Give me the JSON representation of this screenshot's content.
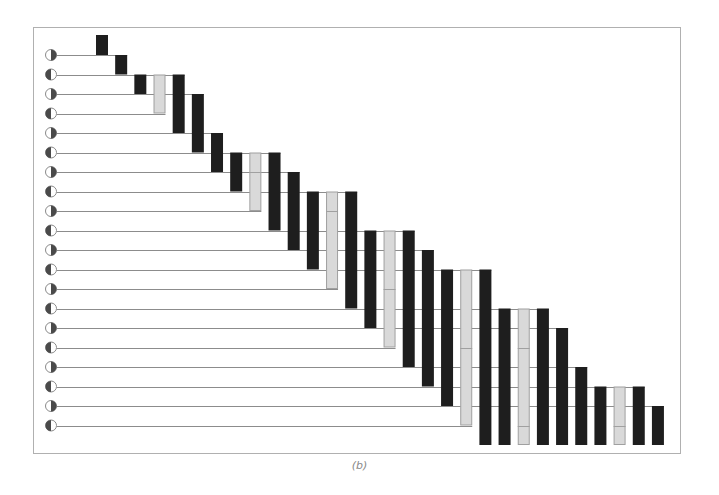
{
  "caption": "(b)",
  "colors": {
    "background": "#ffffff",
    "frame": "#b0b0b0",
    "line": "#8c8c8c",
    "bar_black": "#1e1e1e",
    "bar_gray": "#d9d9d9",
    "bar_gray_outline": "#a0a0a0",
    "circle_fill": "#4a4a4a",
    "circle_stroke": "#8a8a8a"
  },
  "layout": {
    "frame": {
      "x": 33,
      "y": 27,
      "w": 647,
      "h": 426
    },
    "row_y0": 55,
    "row_step": 19.5,
    "col_x0": 96,
    "col_step": 19.17,
    "bar_width": 12,
    "top_y": 35,
    "bottom_y": 445,
    "circle_x": 51,
    "circle_r": 5.5,
    "line_start_x": 57
  },
  "rows": [
    {
      "index": 0,
      "fill": "right",
      "line_end_col": 1
    },
    {
      "index": 1,
      "fill": "left",
      "line_end_col": 4
    },
    {
      "index": 2,
      "fill": "right",
      "line_end_col": 5
    },
    {
      "index": 3,
      "fill": "left",
      "line_end_col": 3
    },
    {
      "index": 4,
      "fill": "right",
      "line_end_col": 6
    },
    {
      "index": 5,
      "fill": "left",
      "line_end_col": 9
    },
    {
      "index": 6,
      "fill": "right",
      "line_end_col": 10
    },
    {
      "index": 7,
      "fill": "left",
      "line_end_col": 13
    },
    {
      "index": 8,
      "fill": "right",
      "line_end_col": 8
    },
    {
      "index": 9,
      "fill": "left",
      "line_end_col": 16
    },
    {
      "index": 10,
      "fill": "right",
      "line_end_col": 17
    },
    {
      "index": 11,
      "fill": "left",
      "line_end_col": 20
    },
    {
      "index": 12,
      "fill": "right",
      "line_end_col": 12
    },
    {
      "index": 13,
      "fill": "left",
      "line_end_col": 23
    },
    {
      "index": 14,
      "fill": "right",
      "line_end_col": 24
    },
    {
      "index": 15,
      "fill": "left",
      "line_end_col": 15
    },
    {
      "index": 16,
      "fill": "right",
      "line_end_col": 25
    },
    {
      "index": 17,
      "fill": "left",
      "line_end_col": 28
    },
    {
      "index": 18,
      "fill": "right",
      "line_end_col": 29
    },
    {
      "index": 19,
      "fill": "left",
      "line_end_col": 19
    }
  ],
  "bars": [
    {
      "col": 0,
      "top": "top",
      "bottom": 0,
      "type": "black"
    },
    {
      "col": 1,
      "top": 0,
      "bottom": 1,
      "type": "black"
    },
    {
      "col": 2,
      "top": 1,
      "bottom": 2,
      "type": "black"
    },
    {
      "col": 3,
      "top": 1,
      "bottom": 3,
      "type": "gray",
      "ticks": []
    },
    {
      "col": 4,
      "top": 1,
      "bottom": 4,
      "type": "black"
    },
    {
      "col": 5,
      "top": 2,
      "bottom": 5,
      "type": "black"
    },
    {
      "col": 6,
      "top": 4,
      "bottom": 6,
      "type": "black"
    },
    {
      "col": 7,
      "top": 5,
      "bottom": 7,
      "type": "black"
    },
    {
      "col": 8,
      "top": 5,
      "bottom": 8,
      "type": "gray",
      "ticks": [
        6
      ]
    },
    {
      "col": 9,
      "top": 5,
      "bottom": 9,
      "type": "black"
    },
    {
      "col": 10,
      "top": 6,
      "bottom": 10,
      "type": "black"
    },
    {
      "col": 11,
      "top": 7,
      "bottom": 11,
      "type": "black"
    },
    {
      "col": 12,
      "top": 7,
      "bottom": 12,
      "type": "gray",
      "ticks": [
        8
      ]
    },
    {
      "col": 13,
      "top": 7,
      "bottom": 13,
      "type": "black"
    },
    {
      "col": 14,
      "top": 9,
      "bottom": 14,
      "type": "black"
    },
    {
      "col": 15,
      "top": 9,
      "bottom": 15,
      "type": "gray",
      "ticks": [
        12
      ]
    },
    {
      "col": 16,
      "top": 9,
      "bottom": 16,
      "type": "black"
    },
    {
      "col": 17,
      "top": 10,
      "bottom": 17,
      "type": "black"
    },
    {
      "col": 18,
      "top": 11,
      "bottom": 18,
      "type": "black"
    },
    {
      "col": 19,
      "top": 11,
      "bottom": 19,
      "type": "gray",
      "ticks": [
        15
      ]
    },
    {
      "col": 20,
      "top": 11,
      "bottom": "bottom",
      "type": "black"
    },
    {
      "col": 21,
      "top": 13,
      "bottom": "bottom",
      "type": "black"
    },
    {
      "col": 22,
      "top": 13,
      "bottom": "bottom",
      "type": "gray",
      "ticks": [
        15,
        19
      ]
    },
    {
      "col": 23,
      "top": 13,
      "bottom": "bottom",
      "type": "black"
    },
    {
      "col": 24,
      "top": 14,
      "bottom": "bottom",
      "type": "black"
    },
    {
      "col": 25,
      "top": 16,
      "bottom": "bottom",
      "type": "black"
    },
    {
      "col": 26,
      "top": 17,
      "bottom": "bottom",
      "type": "black"
    },
    {
      "col": 27,
      "top": 17,
      "bottom": "bottom",
      "type": "gray",
      "ticks": [
        19
      ]
    },
    {
      "col": 28,
      "top": 17,
      "bottom": "bottom",
      "type": "black"
    },
    {
      "col": 29,
      "top": 18,
      "bottom": "bottom",
      "type": "black"
    }
  ]
}
